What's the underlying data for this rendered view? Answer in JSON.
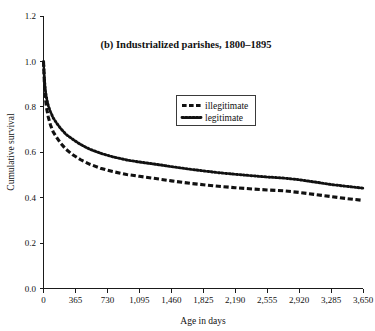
{
  "chart_data": {
    "type": "line",
    "title": "(b) Industrialized parishes, 1800–1895",
    "xlabel": "Age in days",
    "ylabel": "Cumulative survival",
    "xlim": [
      0,
      3650
    ],
    "ylim": [
      0,
      1.2
    ],
    "grid": false,
    "legend_position": "upper-center-right",
    "xticks": [
      0,
      365,
      730,
      1095,
      1460,
      1825,
      2190,
      2555,
      2920,
      3285,
      3650
    ],
    "xticklabels": [
      "0",
      "365",
      "730",
      "1,095",
      "1,460",
      "1,825",
      "2,190",
      "2,555",
      "2,920",
      "3,285",
      "3,650"
    ],
    "yticks": [
      0.0,
      0.2,
      0.4,
      0.6,
      0.8,
      1.0,
      1.2
    ],
    "yticklabels": [
      "0.0",
      "0.2",
      "0.4",
      "0.6",
      "0.8",
      "1.0",
      "1.2"
    ],
    "series": [
      {
        "name": "illegitimate",
        "style": "dashed",
        "color": "#111111",
        "x": [
          0,
          10,
          20,
          35,
          55,
          80,
          110,
          150,
          200,
          260,
          330,
          420,
          530,
          650,
          790,
          950,
          1095,
          1250,
          1460,
          1700,
          1825,
          2000,
          2190,
          2400,
          2555,
          2750,
          2920,
          3100,
          3285,
          3460,
          3650
        ],
        "y": [
          1.0,
          0.905,
          0.845,
          0.795,
          0.755,
          0.72,
          0.69,
          0.665,
          0.638,
          0.612,
          0.59,
          0.568,
          0.547,
          0.53,
          0.515,
          0.502,
          0.494,
          0.486,
          0.474,
          0.462,
          0.457,
          0.45,
          0.444,
          0.438,
          0.434,
          0.43,
          0.423,
          0.414,
          0.405,
          0.396,
          0.388
        ]
      },
      {
        "name": "legitimate",
        "style": "dotted",
        "color": "#111111",
        "x": [
          0,
          10,
          20,
          35,
          55,
          80,
          110,
          150,
          200,
          260,
          330,
          420,
          530,
          650,
          790,
          950,
          1095,
          1250,
          1460,
          1700,
          1825,
          2000,
          2190,
          2400,
          2555,
          2750,
          2920,
          3100,
          3285,
          3460,
          3650
        ],
        "y": [
          1.0,
          0.925,
          0.876,
          0.838,
          0.805,
          0.778,
          0.752,
          0.728,
          0.703,
          0.678,
          0.658,
          0.635,
          0.613,
          0.596,
          0.58,
          0.566,
          0.557,
          0.549,
          0.537,
          0.524,
          0.518,
          0.51,
          0.503,
          0.496,
          0.491,
          0.486,
          0.479,
          0.469,
          0.458,
          0.45,
          0.442
        ]
      }
    ]
  },
  "legend": {
    "items": [
      {
        "label": "illegitimate"
      },
      {
        "label": "legitimate"
      }
    ]
  },
  "colors": {
    "ink": "#111111",
    "axis": "#1a1a1a",
    "background": "#ffffff"
  }
}
